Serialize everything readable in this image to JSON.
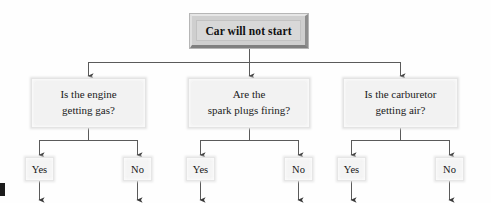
{
  "figure": {
    "title": "Car will not start",
    "background_color": "#fefefe",
    "line_color": "#5a5a5a",
    "root_fill": "#d8d8d8",
    "node_fill": "#f2f2f2"
  },
  "root": {
    "label": "Car will not start"
  },
  "questions": [
    {
      "id": "engine-gas",
      "line1": "Is the engine",
      "line2": "getting gas?"
    },
    {
      "id": "spark-plugs",
      "line1": "Are the",
      "line2": "spark plugs firing?"
    },
    {
      "id": "carburetor-air",
      "line1": "Is the carburetor",
      "line2": "getting air?"
    }
  ],
  "leaves": [
    {
      "id": "engine-gas-yes",
      "label": "Yes"
    },
    {
      "id": "engine-gas-no",
      "label": "No"
    },
    {
      "id": "spark-plugs-yes",
      "label": "Yes"
    },
    {
      "id": "spark-plugs-no",
      "label": "No"
    },
    {
      "id": "carburetor-yes",
      "label": "Yes"
    },
    {
      "id": "carburetor-no",
      "label": "No"
    }
  ]
}
